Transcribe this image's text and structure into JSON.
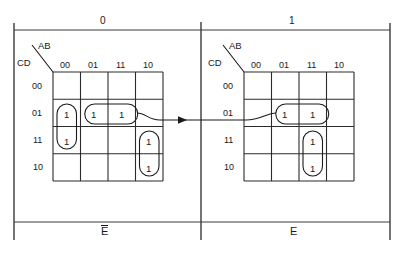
{
  "figure": {
    "top_labels": [
      {
        "text": "0",
        "x": 104,
        "y": 22
      },
      {
        "text": "1",
        "x": 292,
        "y": 22
      }
    ],
    "bottom_labels": [
      {
        "text": "E",
        "overbar": true,
        "x": 104,
        "y": 231
      },
      {
        "text": "E",
        "overbar": false,
        "x": 292,
        "y": 231
      }
    ],
    "frame": {
      "left_tick_x": 14,
      "right_tick_x": 390,
      "center_tick_x": 201,
      "tick_top_y": 23,
      "tick_bottom_y": 240,
      "rule_top_y": 30,
      "rule_bottom_y": 222,
      "line_color": "#3a3a3a"
    },
    "arrow": {
      "y": 120,
      "from_x": 160,
      "to_x": 246,
      "head_x": 186,
      "label": "transfer-arrow"
    }
  },
  "maps": [
    {
      "id": "left-kmap",
      "group_bit": "0",
      "bottom_label": "E",
      "bottom_overbar": true,
      "axis_top_label": "AB",
      "axis_left_label": "CD",
      "col_headers": [
        "00",
        "01",
        "11",
        "10"
      ],
      "row_headers": [
        "00",
        "01",
        "11",
        "10"
      ],
      "grid": {
        "x": 53,
        "y": 72,
        "w": 110,
        "h": 109
      },
      "cells": [
        [
          "",
          "",
          "",
          ""
        ],
        [
          "1",
          "1",
          "1",
          ""
        ],
        [
          "1",
          "",
          "",
          "1"
        ],
        [
          "",
          "",
          "",
          "1"
        ]
      ],
      "groupings": [
        {
          "name": "vertical-pair-col00",
          "col": 0,
          "row": 1,
          "cols": 1,
          "rows": 2
        },
        {
          "name": "horizontal-pair-row01",
          "col": 1,
          "row": 1,
          "cols": 2,
          "rows": 1
        },
        {
          "name": "vertical-pair-col10",
          "col": 3,
          "row": 2,
          "cols": 1,
          "rows": 2
        }
      ]
    },
    {
      "id": "right-kmap",
      "group_bit": "1",
      "bottom_label": "E",
      "bottom_overbar": false,
      "axis_top_label": "AB",
      "axis_left_label": "CD",
      "col_headers": [
        "00",
        "01",
        "11",
        "10"
      ],
      "row_headers": [
        "00",
        "01",
        "11",
        "10"
      ],
      "grid": {
        "x": 244,
        "y": 72,
        "w": 110,
        "h": 109
      },
      "cells": [
        [
          "",
          "",
          "",
          ""
        ],
        [
          "",
          "1",
          "1",
          ""
        ],
        [
          "",
          "",
          "1",
          ""
        ],
        [
          "",
          "",
          "1",
          ""
        ]
      ],
      "groupings": [
        {
          "name": "horizontal-pair-row01",
          "col": 1,
          "row": 1,
          "cols": 2,
          "rows": 1
        },
        {
          "name": "vertical-pair-col11",
          "col": 2,
          "row": 2,
          "cols": 1,
          "rows": 2
        }
      ]
    }
  ],
  "colors": {
    "ink": "#1a1a1a",
    "grid": "#2b2b2b",
    "frame": "#3a3a3a",
    "background": "#ffffff"
  }
}
